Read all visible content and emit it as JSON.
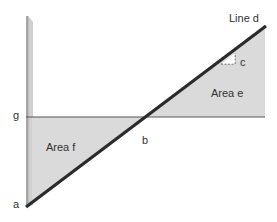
{
  "diagram": {
    "labels": {
      "line_d": "Line d",
      "c": "c",
      "area_e": "Area e",
      "area_f": "Area f",
      "g": "g",
      "b": "b",
      "a": "a"
    },
    "colors": {
      "background": "#ffffff",
      "area_fill": "#d9d9d9",
      "vertical_bar": "#c8c8c8",
      "vertical_bar_edge": "#a8a8a8",
      "line_d": "#2b2b2b",
      "line_g": "#555555",
      "text": "#333333"
    },
    "points": {
      "a": [
        26,
        207
      ],
      "b": [
        145,
        117
      ],
      "g": [
        26,
        117
      ],
      "line_d_end": [
        265,
        27
      ]
    }
  }
}
